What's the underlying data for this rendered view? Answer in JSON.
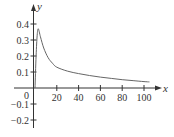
{
  "chart_data": {
    "type": "line",
    "title": "",
    "xlabel": "x",
    "ylabel": "y",
    "xlim": [
      -5,
      110
    ],
    "ylim": [
      -0.25,
      0.45
    ],
    "x_ticks": [
      20,
      40,
      60,
      80,
      100
    ],
    "x_tick_labels": [
      "20",
      "40",
      "60",
      "80",
      "100"
    ],
    "y_ticks": [
      0.4,
      0.3,
      0.2,
      0.1,
      0,
      -0.1,
      -0.2
    ],
    "y_tick_labels": [
      "0.4",
      "0.3",
      "0.2",
      "0.1",
      "0",
      "−0.1",
      "−0.2"
    ],
    "grid": false,
    "legend": null,
    "series": [
      {
        "name": "curve",
        "x": [
          0,
          1,
          2,
          3,
          5,
          8,
          12,
          16,
          20,
          30,
          40,
          50,
          60,
          70,
          80,
          90,
          100,
          105
        ],
        "y": [
          0,
          0.2,
          0.33,
          0.37,
          0.32,
          0.25,
          0.19,
          0.155,
          0.13,
          0.105,
          0.09,
          0.078,
          0.068,
          0.06,
          0.052,
          0.046,
          0.04,
          0.038
        ]
      }
    ],
    "colors": {
      "axis": "#333333",
      "curve": "#666666"
    }
  }
}
